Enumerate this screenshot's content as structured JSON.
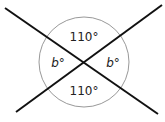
{
  "diagram": {
    "type": "intersecting-lines-angles",
    "angles": {
      "top": "110°",
      "bottom": "110°",
      "left": "b°",
      "right": "b°"
    },
    "colors": {
      "line": "#111111",
      "circle": "#999999",
      "text": "#222222"
    }
  }
}
